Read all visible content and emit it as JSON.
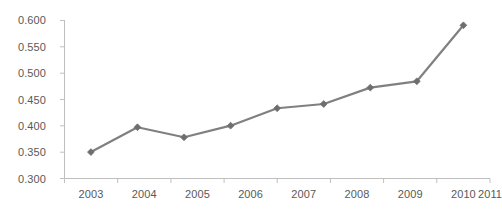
{
  "chart_data": {
    "type": "line",
    "title": "",
    "subtitle": "",
    "xlabel": "",
    "ylabel": "",
    "categories": [
      "2003",
      "2004",
      "2005",
      "2006",
      "2007",
      "2008",
      "2009",
      "2010",
      "2011"
    ],
    "values": [
      0.35,
      0.397,
      0.378,
      0.4,
      0.433,
      0.441,
      0.472,
      0.484,
      0.59
    ],
    "series": [
      {
        "name": "",
        "values": [
          0.35,
          0.397,
          0.378,
          0.4,
          0.433,
          0.441,
          0.472,
          0.484,
          0.59
        ]
      }
    ],
    "ylim": [
      0.3,
      0.6
    ],
    "ytick_values": [
      0.3,
      0.35,
      0.4,
      0.45,
      0.5,
      0.55,
      0.6
    ],
    "ytick_labels": [
      "0.300",
      "0.350",
      "0.400",
      "0.450",
      "0.500",
      "0.550",
      "0.600"
    ],
    "xtick_labels": [
      "2003",
      "2004",
      "2005",
      "2006",
      "2007",
      "2008",
      "2009",
      "2010",
      "2011"
    ],
    "grid": false,
    "legend": false,
    "legend_position": "none",
    "marker": "diamond",
    "line_color": "#808080",
    "marker_color": "#6e6e6e",
    "axis_color": "#bfbfbf",
    "label_color": "#595959",
    "background_color": "#ffffff",
    "annotations": []
  },
  "axes": {
    "y_labels": [
      "0.600",
      "0.550",
      "0.500",
      "0.450",
      "0.400",
      "0.350",
      "0.300"
    ],
    "x_labels": [
      "2003",
      "2004",
      "2005",
      "2006",
      "2007",
      "2008",
      "2009",
      "2010",
      "2011"
    ]
  }
}
